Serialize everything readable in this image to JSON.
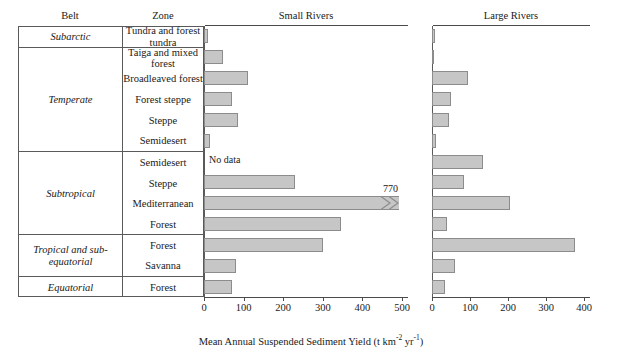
{
  "headers": {
    "belt": "Belt",
    "zone": "Zone",
    "small_rivers": "Small Rivers",
    "large_rivers": "Large Rivers"
  },
  "axis_title": {
    "text": "Mean Annual Suspended Sediment Yield (t km",
    "sup1": "-2",
    "mid": " yr",
    "sup2": "-1",
    "tail": ")"
  },
  "annotations": {
    "no_data": "No data",
    "mediterranean_small_value": "770"
  },
  "belts": [
    {
      "name": "Subarctic",
      "rows": 1
    },
    {
      "name": "Temperate",
      "rows": 5
    },
    {
      "name": "Subtropical",
      "rows": 4
    },
    {
      "name": "Tropical and sub-equatorial",
      "rows": 2
    },
    {
      "name": "Equatorial",
      "rows": 1
    }
  ],
  "zones": [
    "Tundra and forest tundra",
    "Taiga and mixed forest",
    "Broadleaved forest",
    "Forest steppe",
    "Steppe",
    "Semidesert",
    "Semidesert",
    "Steppe",
    "Mediterranean",
    "Forest",
    "Forest",
    "Savanna",
    "Forest"
  ],
  "colors": {
    "bar_fill": "#c6c6c6",
    "bar_stroke": "#8c8c8c",
    "rule": "#4a4a4a",
    "table_border": "#5a5a5a"
  },
  "chart_data": {
    "type": "bar",
    "xlabel": "Mean Annual Suspended Sediment Yield (t km^-2 yr^-1)",
    "ylabel": "",
    "orientation": "horizontal",
    "grid": false,
    "legend": "none",
    "categories": [
      "Subarctic / Tundra and forest tundra",
      "Temperate / Taiga and mixed forest",
      "Temperate / Broadleaved forest",
      "Temperate / Forest steppe",
      "Temperate / Steppe",
      "Temperate / Semidesert",
      "Subtropical / Semidesert",
      "Subtropical / Steppe",
      "Subtropical / Mediterranean",
      "Subtropical / Forest",
      "Tropical and sub-equatorial / Forest",
      "Tropical and sub-equatorial / Savanna",
      "Equatorial / Forest"
    ],
    "panels": [
      {
        "name": "Small Rivers",
        "xlim": [
          0,
          500
        ],
        "xticks": [
          0,
          100,
          200,
          300,
          400,
          500
        ],
        "values": [
          10,
          48,
          110,
          70,
          85,
          15,
          null,
          230,
          770,
          345,
          300,
          80,
          70
        ],
        "broken_bars": [
          {
            "category_index": 8,
            "value": 770,
            "display_label": "770",
            "axis_max": 500
          }
        ],
        "missing": [
          {
            "category_index": 6,
            "label": "No data"
          }
        ]
      },
      {
        "name": "Large Rivers",
        "xlim": [
          0,
          400
        ],
        "xticks": [
          0,
          100,
          200,
          300,
          400
        ],
        "values": [
          8,
          5,
          95,
          50,
          45,
          10,
          135,
          85,
          205,
          40,
          375,
          60,
          35
        ]
      }
    ]
  }
}
